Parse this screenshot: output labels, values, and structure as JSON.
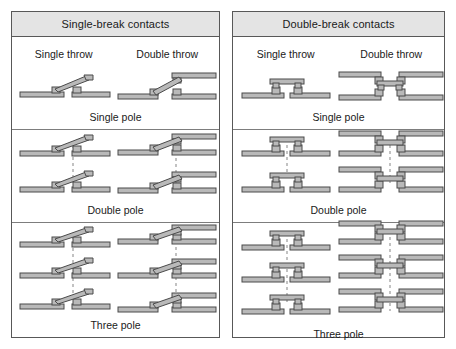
{
  "diagram": {
    "title_semantic": "switch-contact-configurations",
    "panels": [
      {
        "id": "single-break",
        "header": "Single-break contacts",
        "throw_headings": [
          "Single throw",
          "Double throw"
        ],
        "rows": [
          {
            "pole_label": "Single pole",
            "poles": 1
          },
          {
            "pole_label": "Double pole",
            "poles": 2
          },
          {
            "pole_label": "Three pole",
            "poles": 3
          }
        ]
      },
      {
        "id": "double-break",
        "header": "Double-break contacts",
        "throw_headings": [
          "Single throw",
          "Double throw"
        ],
        "rows": [
          {
            "pole_label": "Single pole",
            "poles": 1
          },
          {
            "pole_label": "Double pole",
            "poles": 2
          },
          {
            "pole_label": "Three pole",
            "poles": 3
          }
        ]
      }
    ]
  },
  "style": {
    "panel_border": "#585858",
    "row_divider": "#7d7d7d",
    "header_fill": "#e4e4e4",
    "page_background": "#ffffff",
    "conductor_fill": "#b9b9b9",
    "conductor_stroke": "#4a4a4a",
    "linkage_dash_color": "#9a9a9a"
  }
}
